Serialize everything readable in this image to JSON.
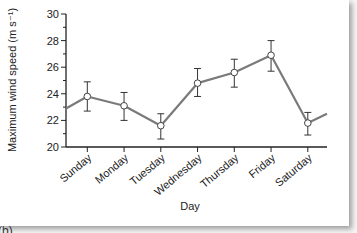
{
  "chart_data": {
    "type": "line",
    "title": "",
    "xlabel": "Day",
    "ylabel": "Maximum wind speed (m s⁻¹)",
    "categories": [
      "Sunday",
      "Monday",
      "Tuesday",
      "Wednesday",
      "Thursday",
      "Friday",
      "Saturday"
    ],
    "series": [
      {
        "name": "Maximum wind speed",
        "values": [
          23.8,
          23.1,
          21.6,
          24.8,
          25.6,
          26.9,
          21.8
        ],
        "error_upper": [
          24.9,
          24.1,
          22.5,
          25.9,
          26.6,
          28.0,
          22.6
        ],
        "error_lower": [
          22.7,
          22.0,
          20.6,
          23.8,
          24.5,
          25.7,
          20.9
        ],
        "line_start_value": 22.9,
        "line_end_value": 22.5
      }
    ],
    "ylim": [
      20,
      30
    ],
    "yticks": [
      20,
      22,
      24,
      26,
      28,
      30
    ],
    "grid": false,
    "legend": "none",
    "marker": "open-circle",
    "line_color": "#7a7a7a"
  },
  "panel_label": "(b)"
}
